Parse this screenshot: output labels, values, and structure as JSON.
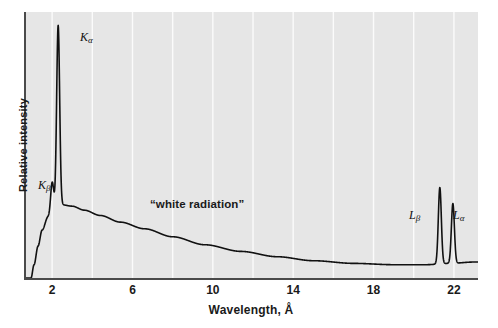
{
  "chart_data": {
    "type": "line",
    "title": "",
    "xlabel": "Wavelength, Å",
    "ylabel": "Relative intensity",
    "xlim": [
      0.6,
      23.2
    ],
    "ylim": [
      0,
      100
    ],
    "grid": "vertical white gridlines at every even wavelength",
    "legend": "none",
    "xticks": [
      2,
      6,
      10,
      14,
      18,
      22
    ],
    "gridlines": [
      2,
      4,
      6,
      8,
      10,
      12,
      14,
      16,
      18,
      20,
      22
    ],
    "series": [
      {
        "name": "continuum",
        "description": "white radiation continuous bremsstrahlung background",
        "x": [
          0.95,
          1.1,
          1.3,
          1.5,
          1.8,
          2.1,
          2.5,
          3.0,
          3.6,
          4.4,
          5.4,
          6.6,
          8.0,
          9.6,
          11.4,
          13.2,
          15.0,
          17.0,
          19.0,
          20.6,
          21.8,
          23.0
        ],
        "y": [
          0,
          5,
          12,
          18,
          23,
          26,
          27.5,
          27,
          25.5,
          23.5,
          21,
          18.5,
          15.5,
          12.5,
          10,
          8,
          6.5,
          5.5,
          5,
          5,
          5.5,
          6
        ]
      },
      {
        "name": "characteristic-lines",
        "description": "sharp K and L emission lines superimposed on the continuum",
        "peaks": [
          {
            "label": "K_beta",
            "wavelength": 2.0,
            "height": 36
          },
          {
            "label": "K_alpha",
            "wavelength": 2.3,
            "height": 95
          },
          {
            "label": "L_beta",
            "wavelength": 21.3,
            "height": 34
          },
          {
            "label": "L_alpha",
            "wavelength": 21.95,
            "height": 28
          }
        ]
      }
    ],
    "annotations": [
      {
        "text": "“white radiation”",
        "wavelength": 9.5,
        "note": "label for the broad continuum"
      }
    ]
  },
  "axes": {
    "y_title": "Relative intensity",
    "x_title": "Wavelength, Å",
    "x_ticks": [
      {
        "label": "2"
      },
      {
        "label": "6"
      },
      {
        "label": "10"
      },
      {
        "label": "14"
      },
      {
        "label": "18"
      },
      {
        "label": "22"
      }
    ]
  },
  "labels": {
    "k_alpha_main": "K",
    "k_alpha_sub": "α",
    "k_beta_main": "K",
    "k_beta_sub": "β",
    "l_alpha_main": "L",
    "l_alpha_sub": "α",
    "l_beta_main": "L",
    "l_beta_sub": "β",
    "white_radiation": "“white radiation”"
  },
  "colors": {
    "plot_background": "#e6e6e6",
    "gridline": "#fbfbfb",
    "curve": "#111111",
    "axis": "#4a4a4a",
    "text": "#1a1a1a",
    "page_background": "#ffffff"
  }
}
